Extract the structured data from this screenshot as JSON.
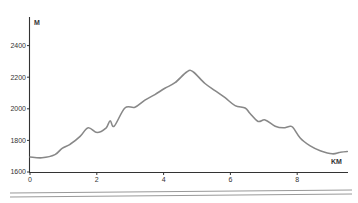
{
  "chart_data": {
    "type": "line",
    "title": "",
    "xlabel": "KM",
    "ylabel": "M",
    "xlim": [
      0,
      9.5
    ],
    "ylim": [
      1600,
      2500
    ],
    "grid": false,
    "legend": null,
    "x_ticks": [
      "0",
      "2",
      "4",
      "6",
      "8"
    ],
    "y_ticks": [
      "1600",
      "1800",
      "2000",
      "2200",
      "2400"
    ],
    "series": [
      {
        "name": "Elevation profile",
        "color": "#888888",
        "x": [
          0.0,
          0.36,
          0.75,
          0.96,
          1.2,
          1.5,
          1.74,
          2.01,
          2.28,
          2.4,
          2.52,
          2.84,
          3.14,
          3.44,
          3.74,
          4.04,
          4.34,
          4.7,
          4.88,
          5.24,
          5.54,
          5.84,
          6.14,
          6.44,
          6.59,
          6.83,
          7.04,
          7.34,
          7.58,
          7.79,
          7.88,
          8.09,
          8.39,
          8.69,
          9.05,
          9.29,
          9.5
        ],
        "values": [
          1695,
          1690,
          1710,
          1750,
          1775,
          1825,
          1880,
          1850,
          1880,
          1925,
          1890,
          2005,
          2010,
          2055,
          2090,
          2130,
          2165,
          2235,
          2235,
          2160,
          2115,
          2070,
          2020,
          2005,
          1970,
          1920,
          1930,
          1890,
          1880,
          1890,
          1880,
          1815,
          1765,
          1735,
          1715,
          1725,
          1730
        ]
      }
    ]
  },
  "labels": {
    "y_unit": "M",
    "x_unit": "KM"
  },
  "colors": {
    "axis": "#333333",
    "line": "#8a8a8a",
    "footer_rule": "#999999"
  }
}
